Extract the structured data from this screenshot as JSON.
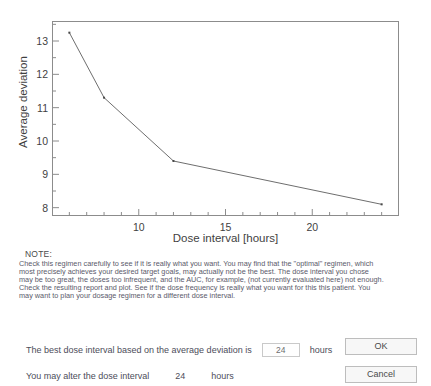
{
  "chart_data": {
    "type": "line",
    "title": "",
    "xlabel": "Dose interval [hours]",
    "ylabel": "Average deviation",
    "x": [
      6,
      8,
      12,
      24
    ],
    "values": [
      13.25,
      11.3,
      9.4,
      8.1
    ],
    "series": [
      {
        "name": "Average deviation",
        "x": [
          6,
          8,
          12,
          24
        ],
        "values": [
          13.25,
          11.3,
          9.4,
          8.1
        ]
      }
    ],
    "xlim": [
      5,
      25
    ],
    "ylim": [
      7.75,
      13.6
    ],
    "xticks": [
      10,
      15,
      20
    ],
    "xtick_labels": [
      "10",
      "15",
      "20"
    ],
    "xminor_step": 1,
    "yticks": [
      8,
      9,
      10,
      11,
      12,
      13
    ],
    "ytick_labels": [
      "8",
      "9",
      "10",
      "11",
      "12",
      "13"
    ],
    "yminor_step": 0.5,
    "grid": false,
    "legend": false,
    "marker": "dot",
    "line_color": "#6e6e6e",
    "axis_color": "#8c8c8c"
  },
  "note": {
    "heading": "NOTE:",
    "lines": [
      "Check this regimen carefully to see if it is really what you want. You may find that the \"optimal\" regimen, which",
      "most precisely achieves your desired target goals, may actually not be the best. The dose interval you chose",
      "may be too great, the doses too infrequent, and the AUC, for example, (not currently evaluated here) not enough.",
      "Check the resulting report and plot. See if the dose frequency is really what you want for this this patient. You",
      "may want to plan your dosage regimen for a different dose interval."
    ]
  },
  "form": {
    "best_interval_label": "The best dose interval based on the average deviation is",
    "best_interval_value": "24",
    "best_interval_unit": "hours",
    "alter_interval_label": "You may alter the dose interval",
    "alter_interval_value": "24",
    "alter_interval_unit": "hours"
  },
  "buttons": {
    "ok": "OK",
    "cancel": "Cancel"
  }
}
